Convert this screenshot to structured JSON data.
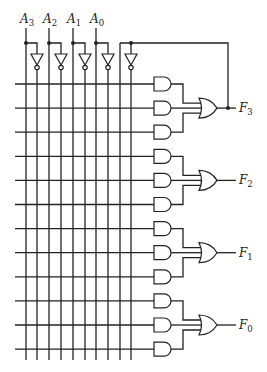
{
  "diagram": {
    "title": "",
    "inputs": [
      {
        "name": "A",
        "sub": "3"
      },
      {
        "name": "A",
        "sub": "2"
      },
      {
        "name": "A",
        "sub": "1"
      },
      {
        "name": "A",
        "sub": "0"
      }
    ],
    "outputs": [
      {
        "name": "F",
        "sub": "3"
      },
      {
        "name": "F",
        "sub": "2"
      },
      {
        "name": "F",
        "sub": "1"
      },
      {
        "name": "F",
        "sub": "0"
      }
    ],
    "feedback": "F3 output fed back as fifth input variable",
    "and_gates_per_output": 3,
    "or_gates": 4,
    "product_lines": 12,
    "colors": {
      "line": "#222222",
      "background": "#ffffff"
    }
  }
}
